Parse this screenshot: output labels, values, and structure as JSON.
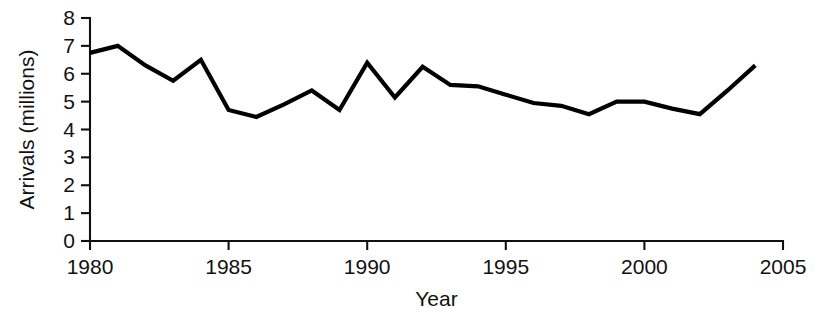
{
  "chart_data": {
    "type": "line",
    "title": "",
    "xlabel": "Year",
    "ylabel": "Arrivals (millions)",
    "xlim": [
      1980,
      2005
    ],
    "ylim": [
      0,
      8
    ],
    "grid": false,
    "legend": "none",
    "x_ticks": [
      "1980",
      "1985",
      "1990",
      "1995",
      "2000",
      "2005"
    ],
    "x_tick_values": [
      1980,
      1985,
      1990,
      1995,
      2000,
      2005
    ],
    "y_ticks": [
      "0",
      "1",
      "2",
      "3",
      "4",
      "5",
      "6",
      "7",
      "8"
    ],
    "y_tick_values": [
      0,
      1,
      2,
      3,
      4,
      5,
      6,
      7,
      8
    ],
    "x": [
      1980,
      1981,
      1982,
      1983,
      1984,
      1985,
      1986,
      1987,
      1988,
      1989,
      1990,
      1991,
      1992,
      1993,
      1994,
      1995,
      1996,
      1997,
      1998,
      1999,
      2000,
      2001,
      2002,
      2003,
      2004
    ],
    "series": [
      {
        "name": "Arrivals",
        "color": "#000000",
        "values": [
          6.75,
          7.0,
          6.3,
          5.75,
          6.5,
          4.7,
          4.45,
          4.9,
          5.4,
          4.7,
          6.4,
          5.15,
          6.25,
          5.6,
          5.55,
          5.25,
          4.95,
          4.85,
          4.55,
          5.0,
          5.0,
          4.75,
          4.55,
          5.4,
          6.3
        ]
      }
    ]
  },
  "figure": {
    "background_color": "#ffffff",
    "axis_color": "#111111"
  }
}
